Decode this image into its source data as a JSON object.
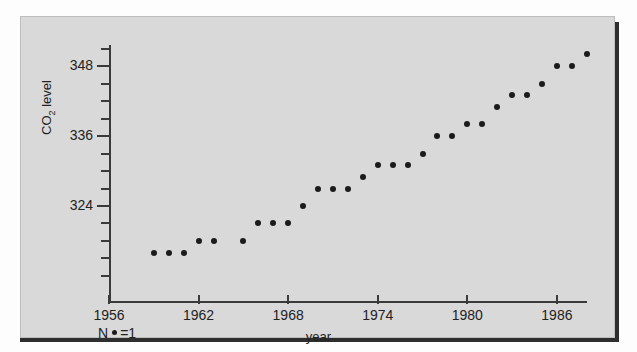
{
  "figure": {
    "background_color": "#d9d9d9",
    "frame_color": "#2e2e2e",
    "marker_color": "#1b1b1b"
  },
  "legend": {
    "prefix": "N",
    "dot_icon": "filled-circle-marker",
    "suffix": "=1",
    "full_text": "N •=1"
  },
  "axes": {
    "y_title_main": "CO",
    "y_title_sub": "2",
    "y_title_tail": " level",
    "x_title": "year",
    "y_tick_labels": [
      "348",
      "336",
      "324"
    ],
    "x_tick_labels": [
      "1956",
      "1962",
      "1968",
      "1974",
      "1980",
      "1986"
    ]
  },
  "chart_data": {
    "type": "scatter",
    "title": "",
    "xlabel": "year",
    "ylabel": "CO2 level",
    "xlim": [
      1954,
      1990
    ],
    "ylim": [
      314,
      352
    ],
    "grid": false,
    "legend": "N •=1",
    "x_ticks": [
      1956,
      1962,
      1968,
      1974,
      1980,
      1986
    ],
    "y_ticks": [
      324,
      336,
      348
    ],
    "y_minor_tick_step": 3,
    "marker": "filled-circle",
    "marker_size": 6,
    "x": [
      1959,
      1960,
      1961,
      1962,
      1963,
      1965,
      1966,
      1967,
      1968,
      1969,
      1970,
      1971,
      1972,
      1973,
      1974,
      1975,
      1976,
      1977,
      1978,
      1979,
      1980,
      1981,
      1982,
      1983,
      1984,
      1985,
      1986,
      1987,
      1988
    ],
    "y": [
      316,
      316,
      316,
      318,
      318,
      318,
      321,
      321,
      321,
      324,
      327,
      327,
      327,
      329,
      331,
      331,
      331,
      333,
      336,
      336,
      338,
      338,
      341,
      343,
      343,
      345,
      348,
      348,
      350
    ],
    "values": [
      {
        "year": 1959,
        "co2": 316
      },
      {
        "year": 1960,
        "co2": 316
      },
      {
        "year": 1961,
        "co2": 316
      },
      {
        "year": 1962,
        "co2": 318
      },
      {
        "year": 1963,
        "co2": 318
      },
      {
        "year": 1965,
        "co2": 318
      },
      {
        "year": 1966,
        "co2": 321
      },
      {
        "year": 1967,
        "co2": 321
      },
      {
        "year": 1968,
        "co2": 321
      },
      {
        "year": 1969,
        "co2": 324
      },
      {
        "year": 1970,
        "co2": 327
      },
      {
        "year": 1971,
        "co2": 327
      },
      {
        "year": 1972,
        "co2": 327
      },
      {
        "year": 1973,
        "co2": 329
      },
      {
        "year": 1974,
        "co2": 331
      },
      {
        "year": 1975,
        "co2": 331
      },
      {
        "year": 1976,
        "co2": 331
      },
      {
        "year": 1977,
        "co2": 333
      },
      {
        "year": 1978,
        "co2": 336
      },
      {
        "year": 1979,
        "co2": 336
      },
      {
        "year": 1980,
        "co2": 338
      },
      {
        "year": 1981,
        "co2": 338
      },
      {
        "year": 1982,
        "co2": 341
      },
      {
        "year": 1983,
        "co2": 343
      },
      {
        "year": 1984,
        "co2": 343
      },
      {
        "year": 1985,
        "co2": 345
      },
      {
        "year": 1986,
        "co2": 348
      },
      {
        "year": 1987,
        "co2": 348
      },
      {
        "year": 1988,
        "co2": 350
      }
    ]
  }
}
